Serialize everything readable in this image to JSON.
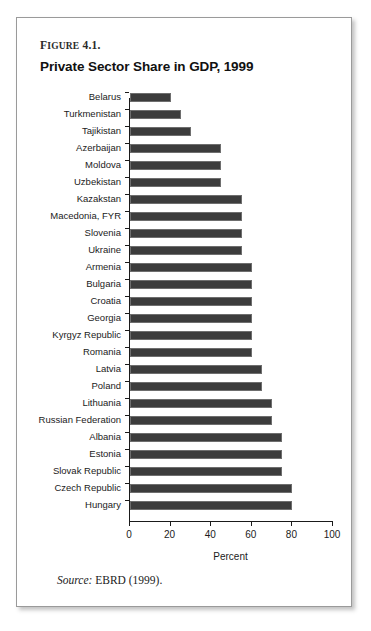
{
  "figure": {
    "label_small": "IGURE",
    "label_lead": "F",
    "label_number": " 4.1.",
    "title": "Private Sector Share in GDP, 1999",
    "source_word": "Source:",
    "source_text": " EBRD (1999)."
  },
  "chart_data": {
    "type": "bar",
    "orientation": "horizontal",
    "title": "Private Sector Share in GDP, 1999",
    "xlabel": "Percent",
    "ylabel": "",
    "xlim": [
      0,
      100
    ],
    "xticks": [
      0,
      20,
      40,
      60,
      80,
      100
    ],
    "xtick_labels": [
      "0",
      "20",
      "40",
      "60",
      "80",
      "100"
    ],
    "grid": false,
    "legend": null,
    "bar_color": "#3c3c3c",
    "categories": [
      "Belarus",
      "Turkmenistan",
      "Tajikistan",
      "Azerbaijan",
      "Moldova",
      "Uzbekistan",
      "Kazakstan",
      "Macedonia, FYR",
      "Slovenia",
      "Ukraine",
      "Armenia",
      "Bulgaria",
      "Croatia",
      "Georgia",
      "Kyrgyz Republic",
      "Romania",
      "Latvia",
      "Poland",
      "Lithuania",
      "Russian Federation",
      "Albania",
      "Estonia",
      "Slovak Republic",
      "Czech Republic",
      "Hungary"
    ],
    "values": [
      20,
      25,
      30,
      45,
      45,
      45,
      55,
      55,
      55,
      55,
      60,
      60,
      60,
      60,
      60,
      60,
      65,
      65,
      70,
      70,
      75,
      75,
      75,
      80,
      80
    ]
  }
}
